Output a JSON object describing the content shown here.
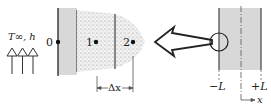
{
  "figure": {
    "boundary_label": "T∞, h",
    "nodes": [
      {
        "id": "0",
        "label": "0"
      },
      {
        "id": "1",
        "label": "1"
      },
      {
        "id": "2",
        "label": "2"
      }
    ],
    "spacing_label": "Δx",
    "slab": {
      "left_label": "−L",
      "right_label": "+L",
      "axis_label": "x"
    },
    "colors": {
      "wall_fill": "#d8d8d8",
      "stipple": "#9a9a9a",
      "line": "#333333"
    }
  }
}
